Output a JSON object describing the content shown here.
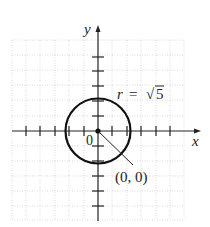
{
  "diagram": {
    "type": "coordinate-plane-circle",
    "axes": {
      "x_label": "x",
      "y_label": "y",
      "origin_label": "0",
      "tick_spacing_units": 1,
      "x_range": [
        -6,
        6
      ],
      "y_range": [
        -6,
        6
      ]
    },
    "circle": {
      "center": [
        0,
        0
      ],
      "radius_label": "r = √5",
      "radius_value": 2.236
    },
    "annotations": {
      "radius_text": "r = √5",
      "r_symbol": "r",
      "equals": "=",
      "sqrt_symbol": "√",
      "sqrt_arg": "5",
      "center_label": "(0, 0)"
    },
    "colors": {
      "axis": "#222222",
      "circle": "#111111",
      "grid": "#bfbfbf",
      "background": "#ffffff"
    }
  }
}
